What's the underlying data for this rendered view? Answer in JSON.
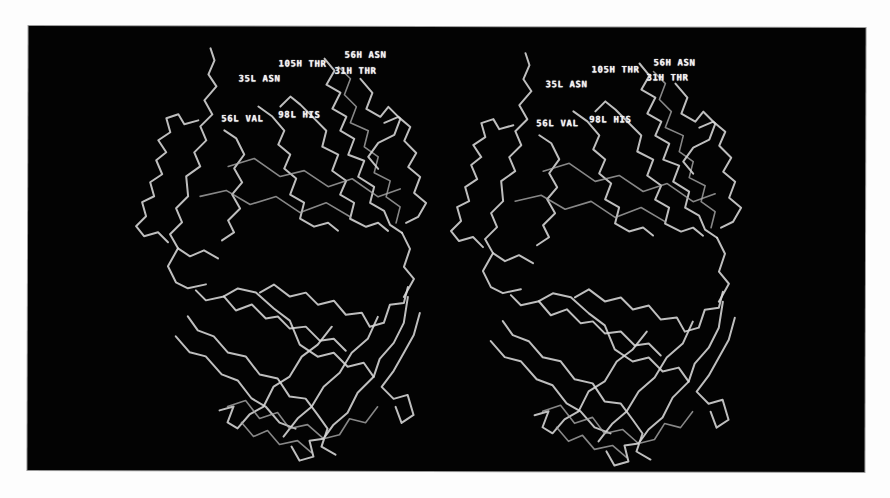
{
  "figure": {
    "type": "stereo-pair",
    "background_color": "#030303",
    "trace_color": "#d8d8d8",
    "views": [
      {
        "name": "left",
        "labels": [
          {
            "text": "105H THR",
            "x": 250,
            "y": 33
          },
          {
            "text": "56H ASN",
            "x": 316,
            "y": 28
          },
          {
            "text": "31H THR",
            "x": 306,
            "y": 43
          },
          {
            "text": "35L ASN",
            "x": 210,
            "y": 48
          },
          {
            "text": "56L VAL",
            "x": 193,
            "y": 88
          },
          {
            "text": "98L HIS",
            "x": 250,
            "y": 86
          }
        ]
      },
      {
        "name": "right",
        "labels": [
          {
            "text": "105H THR",
            "x": 563,
            "y": 38
          },
          {
            "text": "56H ASN",
            "x": 625,
            "y": 33
          },
          {
            "text": "31H THR",
            "x": 618,
            "y": 48
          },
          {
            "text": "35L ASN",
            "x": 517,
            "y": 53
          },
          {
            "text": "56L VAL",
            "x": 508,
            "y": 92
          },
          {
            "text": "98L HIS",
            "x": 561,
            "y": 90
          }
        ]
      }
    ]
  }
}
